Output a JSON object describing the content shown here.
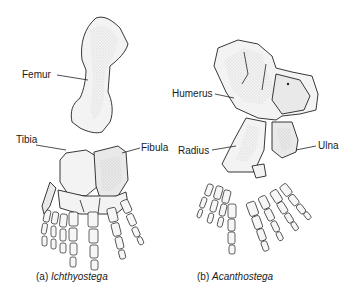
{
  "figure": {
    "panels": [
      {
        "id": "a",
        "caption_prefix": "(a)",
        "caption_taxon": "Ichthyostega",
        "labels": [
          "Femur",
          "Tibia",
          "Fibula"
        ]
      },
      {
        "id": "b",
        "caption_prefix": "(b)",
        "caption_taxon": "Acanthostega",
        "labels": [
          "Humerus",
          "Radius",
          "Ulna"
        ]
      }
    ]
  }
}
